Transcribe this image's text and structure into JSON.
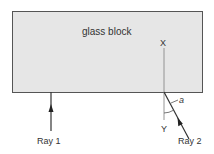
{
  "diagram": {
    "block_label": "glass block",
    "normal_top_label": "X",
    "normal_bottom_label": "Y",
    "angle_label": "a",
    "rays": [
      {
        "label": "Ray 1"
      },
      {
        "label": "Ray 2"
      }
    ],
    "colors": {
      "block_fill": "#e6e6e6",
      "block_border": "#555555",
      "line": "#333333",
      "normal_line": "#888888"
    }
  }
}
